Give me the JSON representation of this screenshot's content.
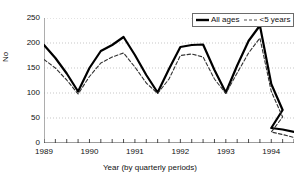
{
  "chart_data": {
    "type": "line",
    "title": "",
    "xlabel": "Year (by quarterly periods)",
    "ylabel": "No",
    "ylim": [
      0,
      250
    ],
    "yticks": [
      0,
      50,
      100,
      150,
      200,
      250
    ],
    "xtick_labels": [
      "1989",
      "1990",
      "1991",
      "1992",
      "1993",
      "1994"
    ],
    "xtick_positions": [
      0,
      4,
      8,
      12,
      16,
      20
    ],
    "x_minor_ticks": 22,
    "grid": true,
    "grid_style": "dotted-horizontal",
    "legend_position": "top-right",
    "x": [
      0,
      1,
      2,
      3,
      4,
      5,
      6,
      7,
      8,
      9,
      10,
      11,
      12,
      13,
      14,
      15,
      16,
      17,
      18,
      19,
      20,
      21
    ],
    "series": [
      {
        "name": "All ages",
        "style": "solid",
        "color": "#000000",
        "width": 2.2,
        "values": [
          196,
          170,
          139,
          103,
          150,
          184,
          196,
          212,
          176,
          136,
          101,
          148,
          192,
          196,
          197,
          146,
          101,
          155,
          204,
          235,
          118,
          66
        ]
      },
      {
        "name": "<5 years",
        "style": "dashed",
        "color": "#333333",
        "width": 1.1,
        "values": [
          167,
          150,
          126,
          98,
          133,
          160,
          172,
          180,
          152,
          120,
          99,
          128,
          175,
          178,
          172,
          128,
          99,
          140,
          180,
          210,
          103,
          52
        ]
      }
    ],
    "tail": {
      "note": "values decline to near zero through 1993-1994",
      "x": [
        20,
        21,
        22
      ],
      "all_ages": [
        30,
        27,
        22
      ],
      "under5": [
        22,
        17,
        11
      ]
    }
  },
  "legend": {
    "items": [
      {
        "label": "All ages",
        "marker": "solid-line-swatch"
      },
      {
        "label": "<5 years",
        "marker": "dashed-line-swatch"
      }
    ]
  }
}
